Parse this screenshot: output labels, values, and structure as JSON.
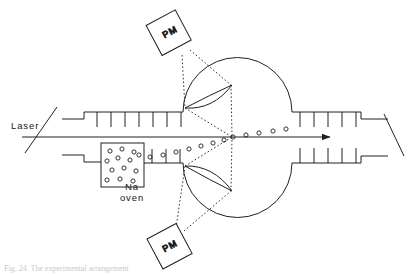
{
  "figure": {
    "type": "apparatus-schematic",
    "title_visible": false,
    "background_color": "#ffffff",
    "line_color": "#202020",
    "caption_partial": "Fig. 24. The experimental arrangement"
  },
  "labels": {
    "laser": "Laser",
    "oven_line1": "Na",
    "oven_line2": "oven",
    "pm_top": "PM",
    "pm_bottom": "PM"
  },
  "components": {
    "laser_beam": {
      "name": "laser-beam-arrow",
      "direction": "left-to-right",
      "y": 137,
      "x_start": 22,
      "x_end": 330
    },
    "vacuum_chamber": {
      "name": "scattering-chamber",
      "shape": "circle",
      "cx": 255,
      "cy": 137,
      "r": 52
    },
    "oven_box": {
      "name": "sodium-oven",
      "x": 101,
      "y": 143,
      "width": 43,
      "height": 44,
      "atom_count": 13
    },
    "upper_tube_ticks": 7,
    "lower_tube_ticks": 4,
    "right_upper_ticks": 6,
    "right_lower_ticks": 6,
    "lens_top": {
      "name": "collection-lens-top"
    },
    "lens_bottom": {
      "name": "collection-lens-bottom"
    },
    "pm_top_box": {
      "name": "photomultiplier-top",
      "rotation_deg": -28
    },
    "pm_bottom_box": {
      "name": "photomultiplier-bottom",
      "rotation_deg": -28
    },
    "brewster_window_left": {
      "name": "entrance-window"
    },
    "brewster_window_right": {
      "name": "exit-window"
    }
  },
  "atom_beam": {
    "name": "sodium-atom-beam",
    "description": "series of small open circles representing Na atoms travelling from oven, deflected onto the laser axis",
    "circle_radius": 2.1,
    "points": [
      [
        150,
        157
      ],
      [
        163,
        155
      ],
      [
        176,
        152
      ],
      [
        189,
        149
      ],
      [
        200,
        146
      ],
      [
        212,
        143
      ],
      [
        224,
        140
      ],
      [
        232,
        137
      ],
      [
        245,
        135
      ],
      [
        258,
        133
      ],
      [
        272,
        131
      ],
      [
        285,
        129
      ]
    ]
  },
  "dotted_rays": {
    "name": "fluorescence-collection-rays",
    "style": "dotted",
    "top": [
      [
        [
          186,
          52
        ],
        [
          185,
          108
        ]
      ],
      [
        [
          186,
          52
        ],
        [
          229,
          84
        ]
      ],
      [
        [
          185,
          108
        ],
        [
          232,
          137
        ]
      ],
      [
        [
          229,
          84
        ],
        [
          232,
          137
        ]
      ]
    ],
    "bottom": [
      [
        [
          175,
          231
        ],
        [
          185,
          166
        ]
      ],
      [
        [
          175,
          231
        ],
        [
          229,
          190
        ]
      ],
      [
        [
          185,
          166
        ],
        [
          232,
          137
        ]
      ],
      [
        [
          229,
          190
        ],
        [
          232,
          137
        ]
      ]
    ]
  }
}
